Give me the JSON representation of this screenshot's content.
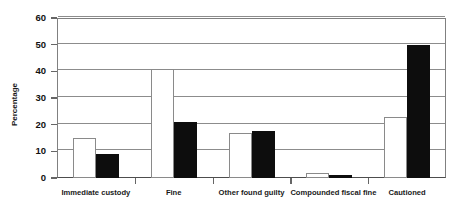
{
  "chart_data": {
    "type": "bar",
    "title": "",
    "xlabel": "",
    "ylabel": "Percentage",
    "ylim": [
      0,
      60
    ],
    "yticks": [
      0,
      10,
      20,
      30,
      40,
      50,
      60
    ],
    "grid": true,
    "legend": "none",
    "categories": [
      "Immediate custody",
      "Fine",
      "Other found guilty",
      "Compounded fiscal fine",
      "Cautioned"
    ],
    "series": [
      {
        "name": "Series 1",
        "color": "#ffffff",
        "border": "#8a8a8a",
        "values": [
          15,
          41,
          17,
          2,
          23
        ]
      },
      {
        "name": "Series 2",
        "color": "#0d0d0d",
        "border": "#0d0d0d",
        "values": [
          9,
          21,
          17.5,
          1,
          50
        ]
      }
    ]
  },
  "axis": {
    "tick_labels": [
      "60",
      "50",
      "40",
      "30",
      "20",
      "10",
      "0"
    ],
    "title": "Percentage"
  },
  "colors": {
    "grid": "#8c8c8c",
    "frame": "#808080",
    "baseline": "#4d4d4d",
    "text": "#1a1a1a"
  }
}
